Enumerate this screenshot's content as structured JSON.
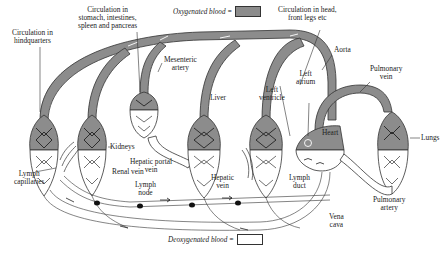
{
  "diagram": {
    "legend": {
      "oxygenated": {
        "label": "Oxygenated blood =",
        "color": "#8c8c8c"
      },
      "deoxygenated": {
        "label": "Deoxygenated blood =",
        "color": "#ffffff"
      }
    },
    "labels": {
      "hindquarters": [
        "Circulation in",
        "hindquarters"
      ],
      "gut": [
        "Circulation in",
        "stomach, intestines,",
        "spleen and pancreas"
      ],
      "head": [
        "Circulation in head,",
        "front legs etc"
      ],
      "aorta": "Aorta",
      "mesenteric": [
        "Mesenteric",
        "artery"
      ],
      "left_atrium": [
        "Left",
        "atrium"
      ],
      "left_ventricle": [
        "Left",
        "ventricle"
      ],
      "pulmonary_vein": [
        "Pulmonary",
        "vein"
      ],
      "liver": "Liver",
      "kidneys": "Kidneys",
      "hepatic_portal_vein": [
        "Hepatic portal",
        "vein"
      ],
      "heart": "Heart",
      "lungs": "Lungs",
      "lymph_capillaries": [
        "Lymph",
        "capillaries"
      ],
      "renal_vein": "Renal vein",
      "lymph_node": [
        "Lymph",
        "node"
      ],
      "hepatic_vein": [
        "Hepatic",
        "vein"
      ],
      "lymph_duct": [
        "Lymph",
        "duct"
      ],
      "pulmonary_artery": [
        "Pulmonary",
        "artery"
      ],
      "vena_cava": [
        "Vena",
        "cava"
      ]
    }
  }
}
